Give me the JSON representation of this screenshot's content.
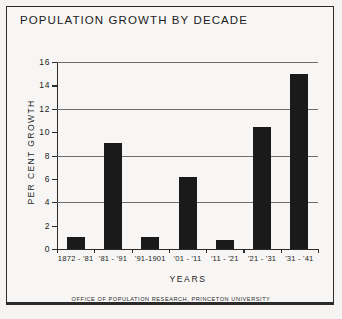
{
  "chart_data": {
    "type": "bar",
    "title": "POPULATION GROWTH BY DECADE",
    "xlabel": "YEARS",
    "ylabel": "PER CENT GROWTH",
    "categories": [
      "1872 - '81",
      "'81 - '91",
      "'91-1901",
      "'01 - '11",
      "'11 - '21",
      "'21 - '31",
      "'31 - '41"
    ],
    "values": [
      1.0,
      9.1,
      1.0,
      6.2,
      0.8,
      10.4,
      15.0
    ],
    "ylim": [
      0,
      16
    ],
    "yticks": [
      0,
      2,
      4,
      6,
      8,
      10,
      12,
      14,
      16
    ],
    "ytick_labels": [
      "0",
      "2",
      "4",
      "6",
      "8",
      "10",
      "12",
      "14",
      "16"
    ],
    "gridlines": [
      4,
      8,
      12,
      16
    ],
    "grid": true,
    "legend": "none",
    "bar_color": "#1a1a1a",
    "axis_color": "#2b2b2b",
    "grid_color": "#6e6e6e",
    "background": "#f7f6f4"
  },
  "footer": {
    "credit": "OFFICE OF POPULATION RESEARCH, PRINCETON UNIVERSITY"
  }
}
